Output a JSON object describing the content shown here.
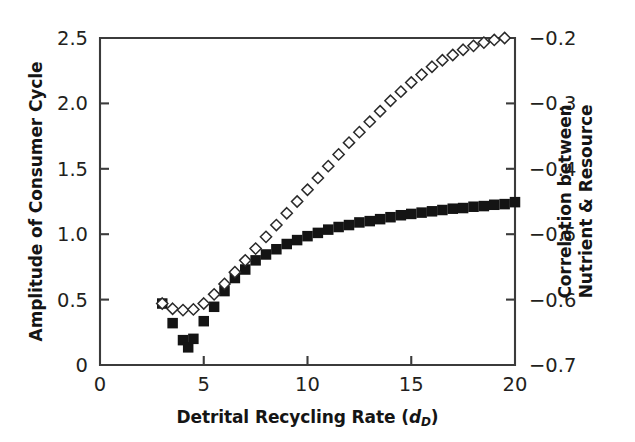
{
  "chart_data": {
    "type": "scatter",
    "title": "",
    "xlabel": "Detrital Recycling Rate (d_D)",
    "xlabel_main": "Detrital Recycling Rate (",
    "xlabel_italic": "d",
    "xlabel_subscript": "D",
    "xlabel_tail": ")",
    "ylabel_left": "Amplitude of Consumer Cycle",
    "ylabel_right_line1": "Correlation between",
    "ylabel_right_line2": "Nutrient & Resource",
    "xlim": [
      0,
      20
    ],
    "xticks": [
      0,
      5,
      10,
      15,
      20
    ],
    "xticklabels": [
      "0",
      "5",
      "10",
      "15",
      "20"
    ],
    "ylim_left": [
      0,
      2.5
    ],
    "yticks_left": [
      0,
      0.5,
      1.0,
      1.5,
      2.0,
      2.5
    ],
    "yticklabels_left": [
      "0",
      "0.5",
      "1.0",
      "1.5",
      "2.0",
      "2.5"
    ],
    "ylim_right": [
      -0.7,
      -0.2
    ],
    "yticks_right": [
      -0.7,
      -0.6,
      -0.5,
      -0.4,
      -0.3,
      -0.2
    ],
    "yticklabels_right": [
      "−0.7",
      "−0.6",
      "−0.5",
      "−0.4",
      "−0.3",
      "−0.2"
    ],
    "grid": false,
    "legend": "none",
    "series": [
      {
        "name": "Amplitude of Consumer Cycle",
        "axis": "left",
        "marker": "filled-square",
        "color": "#141414",
        "x": [
          3.0,
          3.5,
          4.0,
          4.25,
          4.5,
          5.0,
          5.5,
          6.0,
          6.5,
          7.0,
          7.5,
          8.0,
          8.5,
          9.0,
          9.5,
          10.0,
          10.5,
          11.0,
          11.5,
          12.0,
          12.5,
          13.0,
          13.5,
          14.0,
          14.5,
          15.0,
          15.5,
          16.0,
          16.5,
          17.0,
          17.5,
          18.0,
          18.5,
          19.0,
          19.5,
          20.0
        ],
        "y": [
          0.47,
          0.32,
          0.19,
          0.135,
          0.2,
          0.335,
          0.445,
          0.565,
          0.665,
          0.73,
          0.8,
          0.845,
          0.885,
          0.925,
          0.955,
          0.985,
          1.01,
          1.035,
          1.055,
          1.07,
          1.09,
          1.1,
          1.115,
          1.13,
          1.145,
          1.155,
          1.165,
          1.175,
          1.185,
          1.195,
          1.2,
          1.21,
          1.215,
          1.225,
          1.23,
          1.245
        ]
      },
      {
        "name": "Correlation between Nutrient & Resource",
        "axis": "right",
        "marker": "open-diamond",
        "color": "#2a2a2a",
        "x": [
          3.0,
          3.5,
          4.0,
          4.5,
          5.0,
          5.5,
          6.0,
          6.5,
          7.0,
          7.5,
          8.0,
          8.5,
          9.0,
          9.5,
          10.0,
          10.5,
          11.0,
          11.5,
          12.0,
          12.5,
          13.0,
          13.5,
          14.0,
          14.5,
          15.0,
          15.5,
          16.0,
          16.5,
          17.0,
          17.5,
          18.0,
          18.5,
          19.0,
          19.5
        ],
        "y": [
          -0.606,
          -0.614,
          -0.616,
          -0.615,
          -0.606,
          -0.592,
          -0.576,
          -0.558,
          -0.54,
          -0.522,
          -0.504,
          -0.486,
          -0.468,
          -0.45,
          -0.432,
          -0.414,
          -0.396,
          -0.378,
          -0.36,
          -0.344,
          -0.328,
          -0.312,
          -0.296,
          -0.282,
          -0.268,
          -0.256,
          -0.244,
          -0.234,
          -0.226,
          -0.218,
          -0.212,
          -0.207,
          -0.203,
          -0.2
        ]
      }
    ]
  }
}
